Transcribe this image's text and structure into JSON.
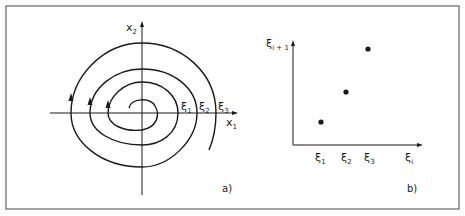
{
  "figure": {
    "panel_a": {
      "label": "a)",
      "axis_x_label": "x",
      "axis_x_sub": "1",
      "axis_y_label": "x",
      "axis_y_sub": "2",
      "crossings": [
        {
          "label": "ξ",
          "sub": "1"
        },
        {
          "label": "ξ",
          "sub": "2"
        },
        {
          "label": "ξ",
          "sub": "3"
        }
      ],
      "description": "Outward spiral trajectory crossing the positive x1 axis at ξ1, ξ2, ξ3"
    },
    "panel_b": {
      "label": "b)",
      "axis_x_label": "ξ",
      "axis_x_sub": "i",
      "axis_y_label": "ξ",
      "axis_y_sub": "i + 1",
      "ticks": [
        {
          "label": "ξ",
          "sub": "1"
        },
        {
          "label": "ξ",
          "sub": "2"
        },
        {
          "label": "ξ",
          "sub": "3"
        }
      ],
      "description": "Return map: successive crossings plotted as ξ(i+1) versus ξ(i)"
    },
    "colors": {
      "ink": "#1a1a1a",
      "frame": "#555555",
      "background": "#ffffff"
    }
  }
}
